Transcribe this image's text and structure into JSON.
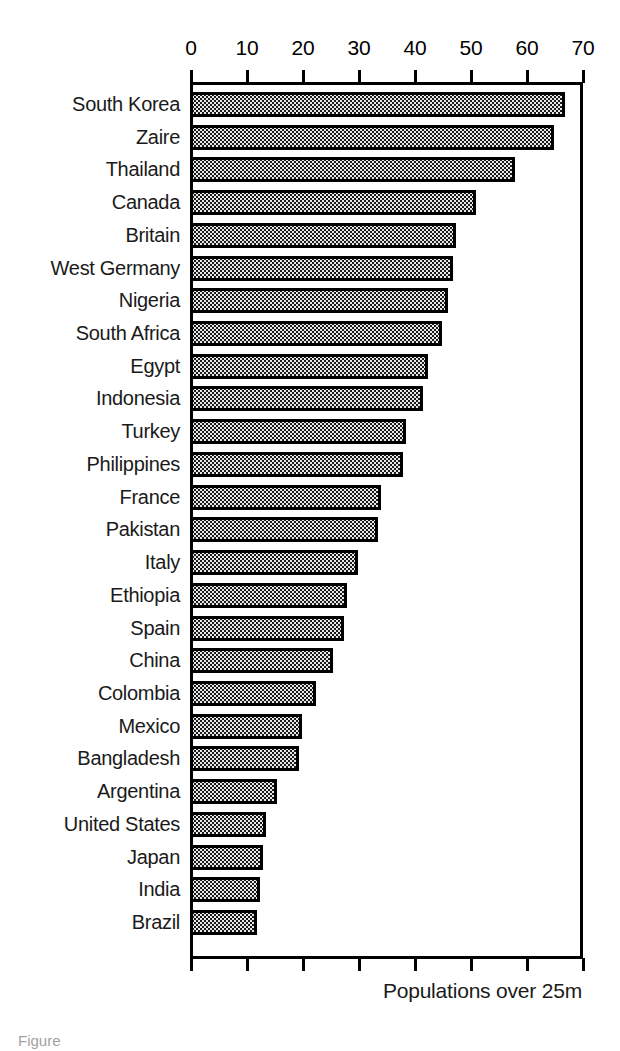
{
  "caption": "Populations over 25m",
  "figure_note": "Figure",
  "chart_data": {
    "type": "bar",
    "orientation": "horizontal",
    "title": "",
    "subtitle": "",
    "xlabel": "Populations over 25m",
    "ylabel": "",
    "xlim": [
      0,
      70
    ],
    "x_ticks": [
      0,
      10,
      20,
      30,
      40,
      50,
      60,
      70
    ],
    "grid": false,
    "legend": null,
    "bar_fill": "stippled-dot-pattern",
    "bar_fill_color": "#e8e8e8",
    "bar_edge_color": "#000000",
    "background_color": "#ffffff",
    "categories": [
      "South Korea",
      "Zaire",
      "Thailand",
      "Canada",
      "Britain",
      "West Germany",
      "Nigeria",
      "South Africa",
      "Egypt",
      "Indonesia",
      "Turkey",
      "Philippines",
      "France",
      "Pakistan",
      "Italy",
      "Ethiopia",
      "Spain",
      "China",
      "Colombia",
      "Mexico",
      "Bangladesh",
      "Argentina",
      "United States",
      "Japan",
      "India",
      "Brazil"
    ],
    "values": [
      66.5,
      64.5,
      57.5,
      50.5,
      47.0,
      46.5,
      45.5,
      44.5,
      42.0,
      41.0,
      38.0,
      37.5,
      33.5,
      33.0,
      29.5,
      27.5,
      27.0,
      25.0,
      22.0,
      19.5,
      19.0,
      15.0,
      13.0,
      12.5,
      12.0,
      11.5
    ]
  }
}
